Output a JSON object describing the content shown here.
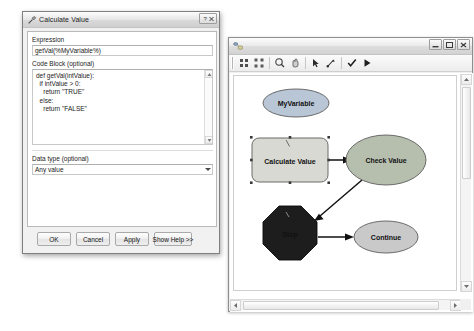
{
  "model_window": {
    "title": "",
    "icon": "model-icon",
    "window_buttons": [
      {
        "name": "minimize-button",
        "glyph": "minimize"
      },
      {
        "name": "maximize-button",
        "glyph": "maximize"
      },
      {
        "name": "close-button",
        "glyph": "close"
      }
    ],
    "toolbar": [
      {
        "name": "tool-add-data",
        "icon": "add-data-icon"
      },
      {
        "name": "tool-auto-layout",
        "icon": "auto-layout-icon"
      },
      {
        "name": "tool-zoom-in",
        "icon": "magnifier-icon"
      },
      {
        "name": "tool-pan",
        "icon": "hand-icon"
      },
      {
        "name": "tool-select",
        "icon": "arrow-pointer-icon"
      },
      {
        "name": "tool-connect",
        "icon": "connect-icon"
      },
      {
        "name": "tool-validate",
        "icon": "checkmark-icon"
      },
      {
        "name": "tool-run",
        "icon": "run-play-icon"
      }
    ],
    "diagram": {
      "nodes": [
        {
          "id": "myvariable",
          "label": "MyVariable",
          "shape": "ellipse",
          "style": "variable-blue",
          "cx": 62,
          "cy": 27,
          "rx": 33,
          "ry": 14,
          "selected": false
        },
        {
          "id": "calculate-value",
          "label": "Calculate Value",
          "shape": "rounded-rect",
          "style": "tool-yellow",
          "x": 18,
          "y": 62,
          "w": 76,
          "h": 44,
          "selected": true
        },
        {
          "id": "check-value",
          "label": "Check Value",
          "shape": "ellipse",
          "style": "variable-green",
          "cx": 152,
          "cy": 84,
          "rx": 40,
          "ry": 25,
          "selected": false
        },
        {
          "id": "stop",
          "label": "Stop",
          "shape": "octagon",
          "style": "stop-dark",
          "cx": 56,
          "cy": 157,
          "r": 27,
          "selected": true
        },
        {
          "id": "continue",
          "label": "Continue",
          "shape": "ellipse",
          "style": "variable-grey",
          "cx": 152,
          "cy": 161,
          "rx": 32,
          "ry": 16,
          "selected": false
        }
      ],
      "connectors": [
        {
          "from": "calculate-value",
          "to": "check-value"
        },
        {
          "from": "check-value",
          "to": "stop"
        },
        {
          "from": "stop",
          "to": "continue"
        }
      ]
    },
    "scrollbars": {
      "vertical": {
        "name": "model-vertical-scrollbar"
      },
      "horizontal": {
        "name": "model-horizontal-scrollbar"
      }
    }
  },
  "calculate_value_dialog": {
    "title": "Calculate Value",
    "icon": "tool-hammer-icon",
    "window_buttons": [
      {
        "name": "help-button",
        "glyph": "help"
      },
      {
        "name": "close-button",
        "glyph": "close"
      }
    ],
    "fields": {
      "expression_label": "Expression",
      "expression_value": "getVal(%MyVariable%)",
      "code_block_label": "Code Block (optional)",
      "code_block_lines": [
        "def getVal(intValue):",
        "  if intValue > 0:",
        "    return \"TRUE\"",
        "  else:",
        "    return \"FALSE\""
      ],
      "data_type_label": "Data type (optional)",
      "data_type_value": "Any value"
    },
    "buttons": [
      {
        "name": "ok-button",
        "label": "OK"
      },
      {
        "name": "cancel-button",
        "label": "Cancel"
      },
      {
        "name": "apply-button",
        "label": "Apply"
      },
      {
        "name": "show-help-button",
        "label": "Show Help >>"
      }
    ]
  },
  "colors": {
    "variable_blue": "#b9c6d6",
    "variable_green": "#b6bfae",
    "variable_grey": "#c9c9c9",
    "tool_yellow": "#d9d9d4",
    "stop_dark": "#1d1d1d",
    "connector": "#111111"
  }
}
